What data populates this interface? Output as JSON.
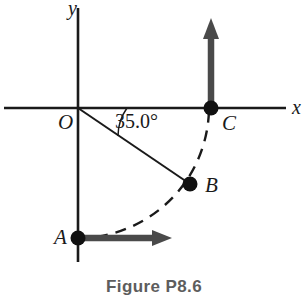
{
  "figure": {
    "caption": "Figure P8.6",
    "background_color": "#ffffff",
    "line_color": "#1a1a1a",
    "arrow_color": "#4a4a4a"
  },
  "axes": {
    "x_label": "x",
    "y_label": "y",
    "origin_label": "O"
  },
  "points": {
    "A": {
      "label": "A",
      "x": 78,
      "y": 238
    },
    "B": {
      "label": "B",
      "x": 190,
      "y": 184
    },
    "C": {
      "label": "C",
      "x": 211,
      "y": 108
    },
    "O": {
      "label": "O",
      "x": 78,
      "y": 108
    }
  },
  "angle": {
    "value": "35.0°",
    "vertex": "O",
    "from": "x-axis",
    "to": "OB"
  },
  "vectors": {
    "at_A": {
      "direction": "right",
      "tip_x": 172,
      "tip_y": 238
    },
    "at_C": {
      "direction": "up",
      "tip_x": 211,
      "tip_y": 18
    }
  },
  "arc": {
    "style": "dashed",
    "from": "A",
    "through": "B",
    "to": "C",
    "center": "O"
  }
}
